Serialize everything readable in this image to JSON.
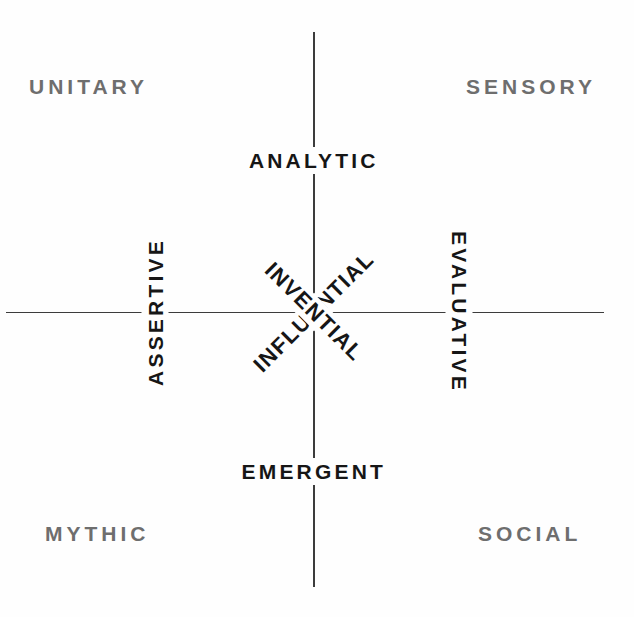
{
  "diagram": {
    "background_color": "#fefefe",
    "axis_color": "#3c3c3c",
    "primary_label_color": "#161616",
    "quadrant_label_color": "#6e6e6e",
    "quadrants": [
      {
        "id": "top-left",
        "label": "UNITARY"
      },
      {
        "id": "top-right",
        "label": "SENSORY"
      },
      {
        "id": "bottom-left",
        "label": "MYTHIC"
      },
      {
        "id": "bottom-right",
        "label": "SOCIAL"
      }
    ],
    "axis_labels": [
      {
        "id": "top",
        "label": "ANALYTIC",
        "orientation": "horizontal",
        "rotation_deg": 0
      },
      {
        "id": "bottom",
        "label": "EMERGENT",
        "orientation": "horizontal",
        "rotation_deg": 0
      },
      {
        "id": "left",
        "label": "ASSERTIVE",
        "orientation": "vertical-up",
        "rotation_deg": -90
      },
      {
        "id": "right",
        "label": "EVALUATIVE",
        "orientation": "vertical-down",
        "rotation_deg": 90
      }
    ],
    "diagonal_labels": [
      {
        "id": "diagonal-up",
        "label": "INFLUENTIAL",
        "rotation_deg": -45
      },
      {
        "id": "diagonal-down",
        "label": "INVENTIAL",
        "rotation_deg": 45
      }
    ]
  }
}
